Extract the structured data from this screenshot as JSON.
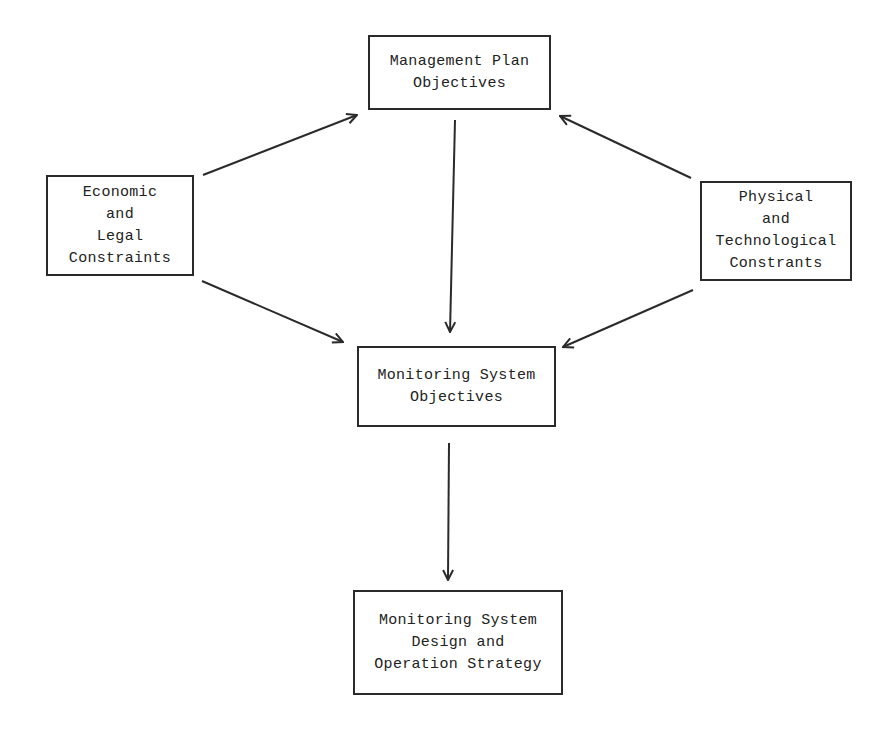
{
  "diagram": {
    "type": "flowchart",
    "nodes": [
      {
        "id": "management",
        "lines": [
          "Management Plan",
          "Objectives"
        ],
        "box": [
          368,
          35,
          183,
          75
        ]
      },
      {
        "id": "economic",
        "lines": [
          "Economic",
          "and",
          "Legal",
          "Constraints"
        ],
        "box": [
          46,
          175,
          148,
          101
        ]
      },
      {
        "id": "physical",
        "lines": [
          "Physical",
          "and",
          "Technological",
          "Constrants"
        ],
        "box": [
          700,
          181,
          152,
          100
        ]
      },
      {
        "id": "monitoring_objectives",
        "lines": [
          "Monitoring System",
          "Objectives"
        ],
        "box": [
          357,
          346,
          199,
          81
        ]
      },
      {
        "id": "design_strategy",
        "lines": [
          "Monitoring System",
          "Design and",
          "Operation Strategy"
        ],
        "box": [
          353,
          590,
          210,
          105
        ]
      }
    ],
    "edges": [
      {
        "from": "economic",
        "to": "management",
        "x1": 203,
        "y1": 175,
        "x2": 357,
        "y2": 115
      },
      {
        "from": "physical",
        "to": "management",
        "x1": 691,
        "y1": 178,
        "x2": 560,
        "y2": 116
      },
      {
        "from": "management",
        "to": "monitoring_objectives",
        "x1": 455,
        "y1": 120,
        "x2": 450,
        "y2": 332
      },
      {
        "from": "economic",
        "to": "monitoring_objectives",
        "x1": 202,
        "y1": 281,
        "x2": 343,
        "y2": 342
      },
      {
        "from": "physical",
        "to": "monitoring_objectives",
        "x1": 693,
        "y1": 290,
        "x2": 563,
        "y2": 347
      },
      {
        "from": "monitoring_objectives",
        "to": "design_strategy",
        "x1": 449,
        "y1": 443,
        "x2": 448,
        "y2": 580
      }
    ]
  }
}
